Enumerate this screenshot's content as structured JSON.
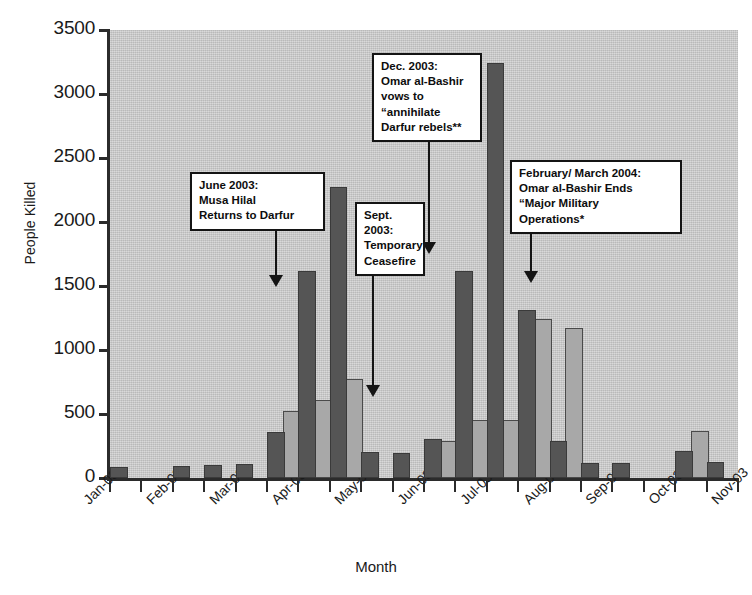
{
  "chart_data": {
    "type": "bar",
    "title": "",
    "xlabel": "Month",
    "ylabel": "People Killed",
    "ylim": [
      0,
      3500
    ],
    "yticks": [
      0,
      500,
      1000,
      1500,
      2000,
      2500,
      3000,
      3500
    ],
    "grid": false,
    "legend": "none",
    "categories": [
      "Jan-03",
      "Feb-03",
      "Mar-03",
      "Apr-03",
      "May-03",
      "Jun-03",
      "Jul-03",
      "Aug-03",
      "Sep-03",
      "Oct-03",
      "Nov-03",
      "Dec-03",
      "Jan-04",
      "Feb-04",
      "Mar-04",
      "Apr-04",
      "May-04",
      "Jun-04",
      "Jul-04",
      "Aug-04"
    ],
    "series": [
      {
        "name": "dark",
        "color": "#555555",
        "values": [
          70,
          0,
          80,
          85,
          90,
          345,
          1600,
          2260,
          190,
          180,
          290,
          1600,
          3230,
          1300,
          270,
          100,
          100,
          0,
          195,
          110
        ]
      },
      {
        "name": "light",
        "color": "#a8a8a8",
        "values": [
          0,
          0,
          0,
          0,
          0,
          510,
          590,
          760,
          0,
          0,
          270,
          440,
          440,
          1230,
          1160,
          0,
          0,
          0,
          355,
          0
        ]
      }
    ],
    "annotations": [
      {
        "id": "june-2003",
        "text": "June 2003:\nMusa Hilal\nReturns to Darfur",
        "points_to": "Jun-03"
      },
      {
        "id": "sept-2003",
        "text": "Sept.\n2003:\nTemporary\nCeasefire",
        "points_to": "Sep-03"
      },
      {
        "id": "dec-2003",
        "text": "Dec. 2003:\nOmar al-Bashir\nvows to\n“annihilate\nDarfur rebels**",
        "points_to": "Dec-03"
      },
      {
        "id": "feb-mar-2004",
        "text": "February/ March 2004:\nOmar al-Bashir Ends\n“Major Military\nOperations*",
        "points_to": "Feb-04"
      }
    ],
    "colors": {
      "plot_background": "#c9c9c9",
      "axis": "#2b2b2b",
      "annotation_border": "#141414",
      "page_background": "#ffffff"
    }
  }
}
